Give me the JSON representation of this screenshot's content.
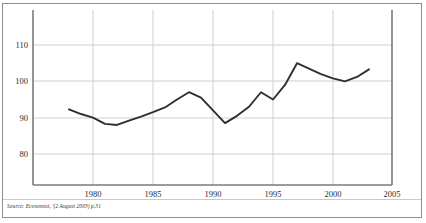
{
  "figure": {
    "source_note": "Source: Economist, '(2 August 2003) p.31",
    "frame_color": "#8d8d8d",
    "line_color": "#2f2f2f",
    "grid_color": "#cfcfcf",
    "axis_color": "#7a7a7a",
    "background": "#ffffff"
  },
  "chart_data": {
    "type": "line",
    "title": "",
    "subtitle": "",
    "xlabel": "",
    "ylabel": "",
    "xlim": [
      1977.5,
      2005
    ],
    "ylim": [
      74,
      114
    ],
    "grid": true,
    "legend": "none",
    "x_ticks": [
      "1980",
      "1985",
      "1990",
      "1995",
      "2000",
      "2005"
    ],
    "x_tick_values": [
      1980,
      1985,
      1990,
      1995,
      2000,
      2005
    ],
    "y_ticks": [
      "80",
      "90",
      "100",
      "110"
    ],
    "y_tick_values": [
      80,
      90,
      100,
      110
    ],
    "x": [
      1978,
      1979,
      1980,
      1981,
      1982,
      1983,
      1984,
      1985,
      1986,
      1987,
      1988,
      1989,
      1990,
      1991,
      1992,
      1993,
      1994,
      1995,
      1996,
      1997,
      1998,
      1999,
      2000,
      2001,
      2002,
      2003
    ],
    "series": [
      {
        "name": "index",
        "values": [
          92.3,
          91.0,
          90.0,
          88.3,
          88.0,
          89.2,
          90.3,
          91.5,
          92.8,
          95.0,
          97.0,
          95.5,
          92.0,
          88.5,
          90.5,
          93.0,
          97.0,
          95.0,
          99.0,
          105.0,
          103.5,
          102.0,
          100.8,
          100.0,
          101.2,
          103.3
        ]
      }
    ],
    "annotations": []
  }
}
